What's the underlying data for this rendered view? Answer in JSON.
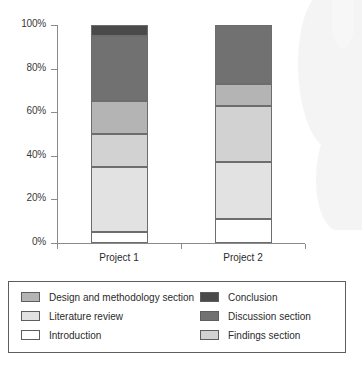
{
  "chart_data": {
    "type": "bar",
    "subtype": "stacked-bar-100pct",
    "title": "",
    "xlabel": "",
    "ylabel": "",
    "ylim": [
      0,
      100
    ],
    "ytick_labels": [
      "0%",
      "20%",
      "40%",
      "60%",
      "80%",
      "100%"
    ],
    "ytick_values": [
      0,
      20,
      40,
      60,
      80,
      100
    ],
    "grid": false,
    "legend_position": "bottom",
    "categories": [
      "Project 1",
      "Project 2"
    ],
    "series": [
      {
        "name": "Introduction",
        "values": [
          5,
          11
        ],
        "color": "#ffffff"
      },
      {
        "name": "Literature review",
        "values": [
          30,
          26
        ],
        "color": "#e2e2e2"
      },
      {
        "name": "Findings section",
        "values": [
          15,
          26
        ],
        "color": "#d2d2d2"
      },
      {
        "name": "Design and methodology section",
        "values": [
          15,
          10
        ],
        "color": "#b4b4b4"
      },
      {
        "name": "Discussion section",
        "values": [
          30,
          27
        ],
        "color": "#717171"
      },
      {
        "name": "Conclusion",
        "values": [
          5,
          0
        ],
        "color": "#4a4a4a"
      }
    ],
    "cumulative_boundaries": {
      "Project 1": [
        0,
        5,
        35,
        50,
        65,
        95,
        100
      ],
      "Project 2": [
        0,
        11,
        37,
        63,
        73,
        100,
        100
      ]
    }
  },
  "legend": {
    "left_column": [
      {
        "label": "Design and methodology section",
        "color": "#b4b4b4"
      },
      {
        "label": "Literature review",
        "color": "#e2e2e2"
      },
      {
        "label": "Introduction",
        "color": "#ffffff"
      }
    ],
    "right_column": [
      {
        "label": "Conclusion",
        "color": "#4a4a4a"
      },
      {
        "label": "Discussion section",
        "color": "#717171"
      },
      {
        "label": "Findings section",
        "color": "#d2d2d2"
      }
    ]
  },
  "axis": {
    "y_ticks": [
      "0%",
      "20%",
      "40%",
      "60%",
      "80%",
      "100%"
    ],
    "x_ticks": [
      "Project 1",
      "Project 2"
    ]
  }
}
